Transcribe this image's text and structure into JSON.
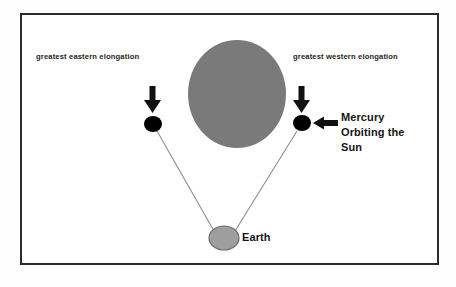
{
  "diagram": {
    "title_alt": "Mercury greatest elongation diagram",
    "frame": {
      "border_color": "#2b2b2b",
      "background_color": "#ffffff"
    },
    "labels": {
      "eastern_elongation": "greatest eastern elongation",
      "western_elongation": "greatest western elongation",
      "mercury_line1": "Mercury",
      "mercury_line2": "Orbiting the",
      "mercury_line3": "Sun",
      "earth": "Earth"
    },
    "bodies": [
      {
        "name": "sun",
        "shape": "ellipse",
        "cx": 237,
        "cy": 94,
        "rx": 49,
        "ry": 54,
        "fill": "#7a7a7a",
        "stroke": "none"
      },
      {
        "name": "mercury-eastern",
        "shape": "ellipse",
        "cx": 153,
        "cy": 124,
        "rx": 9,
        "ry": 8,
        "fill": "#000000",
        "stroke": "none"
      },
      {
        "name": "mercury-western",
        "shape": "ellipse",
        "cx": 302,
        "cy": 123,
        "rx": 9,
        "ry": 8,
        "fill": "#000000",
        "stroke": "none"
      },
      {
        "name": "earth",
        "shape": "ellipse",
        "cx": 224,
        "cy": 238,
        "rx": 15,
        "ry": 12,
        "fill": "#9e9e9e",
        "stroke": "#6e6e6e"
      }
    ],
    "sight_lines": [
      {
        "name": "sight-line-eastern",
        "x1": 157,
        "y1": 131,
        "x2": 214,
        "y2": 231,
        "stroke": "#8d8d8d",
        "width": 1.1
      },
      {
        "name": "sight-line-western",
        "x1": 297,
        "y1": 131,
        "x2": 235,
        "y2": 231,
        "stroke": "#8d8d8d",
        "width": 1.1
      }
    ],
    "arrows": [
      {
        "name": "arrow-down-eastern",
        "direction": "down",
        "x": 153,
        "y_top": 86,
        "y_tip": 112,
        "color": "#111111"
      },
      {
        "name": "arrow-down-western",
        "direction": "down",
        "x": 302,
        "y_top": 86,
        "y_tip": 112,
        "color": "#111111"
      },
      {
        "name": "arrow-left-mercury",
        "direction": "left",
        "x_tail": 337,
        "x_tip": 314,
        "y": 123,
        "color": "#111111"
      }
    ],
    "colors": {
      "sun_gray": "#7a7a7a",
      "earth_gray": "#9e9e9e",
      "mercury_black": "#000000",
      "line_gray": "#8d8d8d",
      "border": "#2b2b2b",
      "text": "#1a1a1a"
    }
  }
}
